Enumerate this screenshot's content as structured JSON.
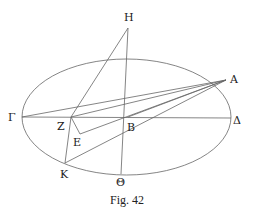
{
  "caption": "Fig. 42",
  "points": {
    "H": {
      "label": "Η"
    },
    "A": {
      "label": "Α"
    },
    "Gamma": {
      "label": "Γ"
    },
    "Delta": {
      "label": "Δ"
    },
    "Z": {
      "label": "Ζ"
    },
    "B": {
      "label": "Β"
    },
    "E": {
      "label": "Ε"
    },
    "K": {
      "label": "Κ"
    },
    "Theta": {
      "label": "Θ"
    }
  },
  "segments": [
    [
      "H",
      "Z"
    ],
    [
      "H",
      "Theta"
    ],
    [
      "Gamma",
      "Delta"
    ],
    [
      "Gamma",
      "A"
    ],
    [
      "Z",
      "A"
    ],
    [
      "E",
      "A"
    ],
    [
      "K",
      "A"
    ],
    [
      "Z",
      "E"
    ],
    [
      "Z",
      "K"
    ]
  ],
  "colors": {
    "line": "#666666",
    "text": "#222222"
  }
}
